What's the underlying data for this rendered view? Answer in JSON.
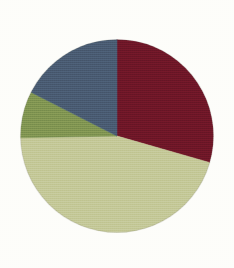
{
  "figure": {
    "title": "",
    "background_color": "#fdfdfa"
  },
  "chart_data": {
    "type": "pie",
    "title": "",
    "xlabel": "",
    "ylabel": "",
    "grid": false,
    "legend": "none",
    "labels_shown": false,
    "start_angle_deg": 0,
    "direction": "clockwise",
    "center": {
      "x": 117,
      "y": 136
    },
    "radius": 96.5,
    "categories": [
      "Dark Red",
      "Sage Green",
      "Olive Green",
      "Slate Blue"
    ],
    "values": [
      29.4,
      45.3,
      7.8,
      17.5
    ],
    "colors": [
      "#6b1427",
      "#c2c694",
      "#7b9150",
      "#46596e"
    ],
    "slices": [
      {
        "name": "Dark Red",
        "value": 29.4,
        "color": "#6b1427",
        "start_angle_deg": 0,
        "end_angle_deg": 106
      },
      {
        "name": "Sage Green",
        "value": 45.3,
        "color": "#c2c694",
        "start_angle_deg": 106,
        "end_angle_deg": 269
      },
      {
        "name": "Olive Green",
        "value": 7.8,
        "color": "#7b9150",
        "start_angle_deg": 269,
        "end_angle_deg": 297
      },
      {
        "name": "Slate Blue",
        "value": 17.5,
        "color": "#46596e",
        "start_angle_deg": 297,
        "end_angle_deg": 360
      }
    ]
  }
}
